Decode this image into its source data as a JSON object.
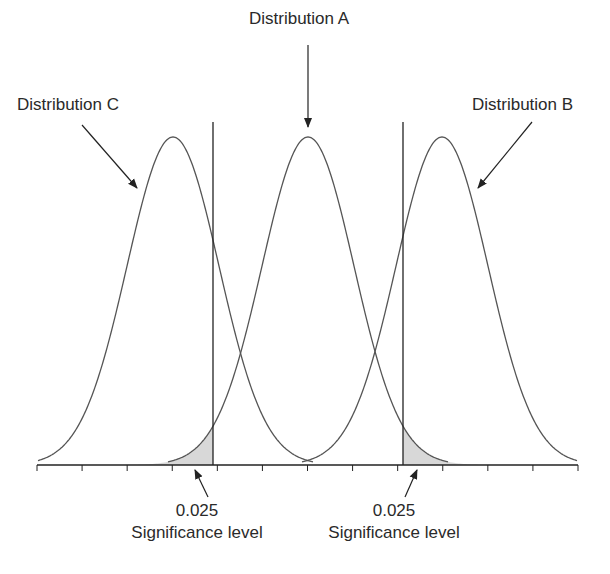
{
  "labels": {
    "dist_a": "Distribution A",
    "dist_b": "Distribution B",
    "dist_c": "Distribution C"
  },
  "annotations": [
    {
      "value": "0.025",
      "caption": "Significance level"
    },
    {
      "value": "0.025",
      "caption": "Significance level"
    }
  ],
  "colors": {
    "line": "#555555",
    "shade": "#d8d8d8",
    "axis": "#222222"
  },
  "diagram": {
    "curves": [
      {
        "name": "Distribution C",
        "peak_x": 173
      },
      {
        "name": "Distribution A",
        "peak_x": 308
      },
      {
        "name": "Distribution B",
        "peak_x": 442
      }
    ],
    "critical_lines_x": [
      213,
      403
    ],
    "tick_count": 13
  }
}
